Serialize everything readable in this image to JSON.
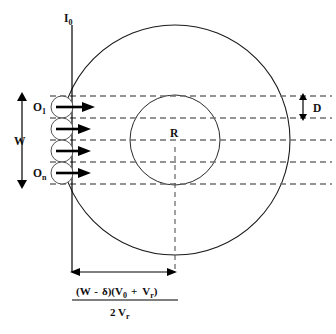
{
  "figure": {
    "type": "technical-diagram",
    "labels": {
      "top_axis": "I",
      "top_axis_sub": "0",
      "source_first": "O",
      "source_first_sub": "1",
      "source_last": "O",
      "source_last_sub": "n",
      "width_label": "W",
      "spacing_label": "D",
      "radius_label": "R"
    },
    "formula": {
      "numerator_parts": [
        {
          "text": "(W",
          "sub": ""
        },
        {
          "text": "-",
          "sub": ""
        },
        {
          "text": "δ)(V",
          "sub": "0"
        },
        {
          "text": "+",
          "sub": ""
        },
        {
          "text": "V",
          "sub": "r"
        },
        {
          "text": ")",
          "sub": ""
        }
      ],
      "numerator_plain": "(W - δ)(V0 + Vr)",
      "denominator_plain": "2 Vr",
      "denominator_main": "2 V",
      "denominator_sub": "r"
    },
    "geometry": {
      "outer_circle": {
        "cx": 175,
        "cy": 140,
        "r": 115
      },
      "inner_circle": {
        "cx": 175,
        "cy": 140,
        "r": 45
      },
      "vertical_axis_x": 72,
      "vertical_axis_top": 25,
      "vertical_axis_bottom": 272,
      "dashed_line_ys": [
        96,
        118,
        140,
        162,
        184
      ],
      "source_circles": [
        {
          "cx": 62,
          "cy": 107,
          "r": 11
        },
        {
          "cx": 62,
          "cy": 129,
          "r": 11
        },
        {
          "cx": 62,
          "cy": 151,
          "r": 11
        },
        {
          "cx": 62,
          "cy": 173,
          "r": 11
        }
      ],
      "dimension_arrow": {
        "x1": 72,
        "x2": 175,
        "y": 272
      },
      "width_arrow": {
        "x": 22,
        "y1": 95,
        "y2": 186
      },
      "spacing_arrow": {
        "x": 305,
        "y1": 96,
        "y2": 118
      }
    },
    "colors": {
      "stroke": "#1a1a1a",
      "dashed": "#707070",
      "background": "#ffffff",
      "text": "#111111"
    }
  }
}
